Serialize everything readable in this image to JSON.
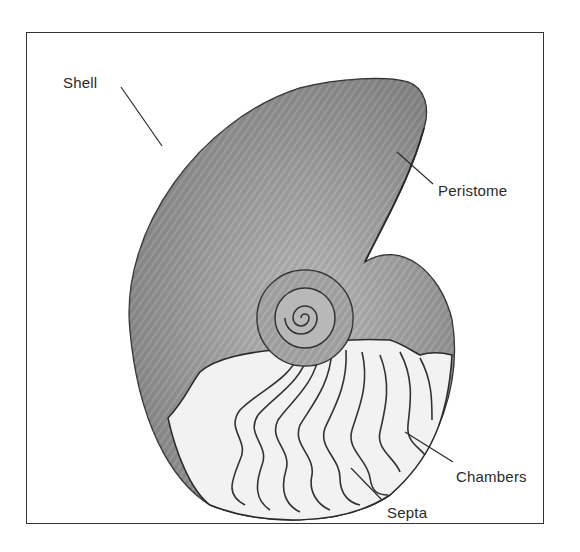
{
  "figure": {
    "labels": [
      {
        "id": "shell",
        "text": "Shell"
      },
      {
        "id": "peristome",
        "text": "Peristome"
      },
      {
        "id": "chambers",
        "text": "Chambers"
      },
      {
        "id": "septa",
        "text": "Septa"
      }
    ]
  },
  "colors": {
    "line": "#2a2a2a",
    "shell_fill": "#8c8c8c",
    "chamber_fill": "#f2f2f2",
    "background": "#ffffff"
  }
}
